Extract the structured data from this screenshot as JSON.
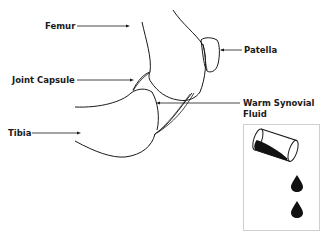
{
  "diagram": {
    "labels": {
      "femur": "Femur",
      "patella": "Patella",
      "joint_capsule": "Joint Capsule",
      "synovial_line1": "Warm Synovial",
      "synovial_line2": "Fluid",
      "tibia": "Tibia"
    },
    "inset": {
      "description": "Tipped container pouring drops",
      "drop_count": 2
    },
    "colors": {
      "stroke": "#1a1a1a",
      "background": "#ffffff",
      "inset_border": "#cfcfcf"
    }
  }
}
